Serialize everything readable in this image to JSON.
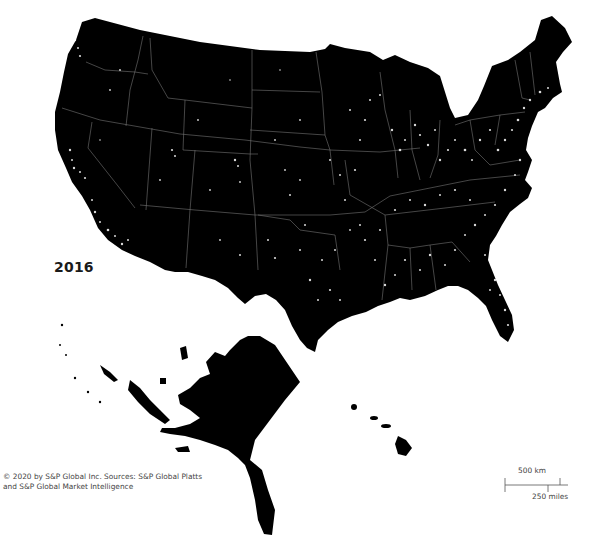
{
  "map": {
    "year": "2016",
    "background_color": "#ffffff",
    "land_color": "#000000",
    "light_color": "#ffffff",
    "state_border_color": "#9a9a9a",
    "regions": [
      "Contiguous United States",
      "Alaska",
      "Hawaii"
    ]
  },
  "credit": {
    "line1": "© 2020 by S&P Global Inc. Sources: S&P Global Platts",
    "line2": "and S&P Global Market Intelligence"
  },
  "scale": {
    "km_label": "500 km",
    "miles_label": "250 miles"
  }
}
